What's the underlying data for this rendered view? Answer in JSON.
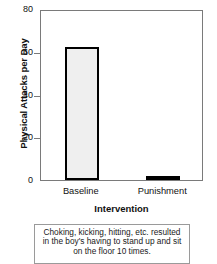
{
  "chart_data": {
    "type": "bar",
    "title": "",
    "subtitle": "",
    "categories": [
      "Baseline",
      "Punishment"
    ],
    "values": [
      62,
      2
    ],
    "xlabel": "Intervention",
    "ylabel": "Physical Attacks per Day",
    "ylim": [
      0,
      80
    ],
    "yticks": [
      0,
      20,
      40,
      60,
      80
    ],
    "ytick_labels": [
      "0",
      "20",
      "40",
      "60",
      "80"
    ],
    "grid": false,
    "legend": null,
    "legend_position": "none",
    "series": [
      {
        "name": "Physical Attacks per Day",
        "values": [
          62,
          2
        ]
      }
    ],
    "bar_fill_color": "#efefef",
    "bar_edge_color": "#000000",
    "axis_color": "#7a7a7a",
    "text_color": "#111111"
  },
  "caption": {
    "lines": [
      "Choking, kicking, hitting, etc. resulted",
      "in the boy's having to stand up and sit",
      "on the floor 10 times."
    ]
  }
}
